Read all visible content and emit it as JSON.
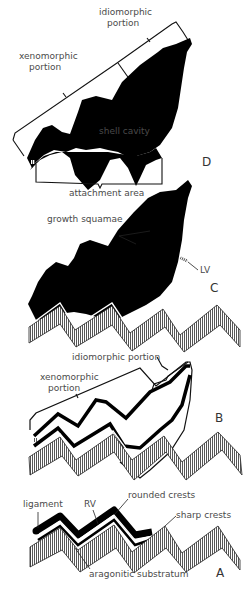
{
  "figure": {
    "stages": [
      {
        "id": "D",
        "label": "D",
        "annotations": {
          "idiomorphic": "idiomorphic",
          "idiomorphic_2": "portion",
          "xenomorphic": "xenomorphic",
          "xenomorphic_2": "portion",
          "cavity": "shell cavity",
          "attachment": "attachment area"
        }
      },
      {
        "id": "C",
        "label": "C",
        "annotations": {
          "squamae": "growth squamae",
          "lv": "LV"
        }
      },
      {
        "id": "B",
        "label": "B",
        "annotations": {
          "idiomorphic": "idiomorphic portion",
          "xenomorphic": "xenomorphic",
          "xenomorphic_2": "portion"
        }
      },
      {
        "id": "A",
        "label": "A",
        "annotations": {
          "ligament": "ligament",
          "rv": "RV",
          "rounded": "rounded crests",
          "sharp": "sharp crests",
          "substratum": "aragonitic substratum"
        }
      }
    ],
    "colors": {
      "shell": "#000000",
      "substratum_hatch": "#555555",
      "text": "#4a4a4a",
      "background": "#ffffff"
    }
  }
}
